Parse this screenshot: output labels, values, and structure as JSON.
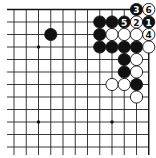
{
  "diagram": {
    "type": "go-board-fragment",
    "grid": {
      "columns": 12,
      "rows": 12,
      "edges": [
        "top",
        "right"
      ]
    },
    "colors": {
      "black": "#111111",
      "white": "#ffffff",
      "line": "#222222",
      "background": "#ffffff"
    },
    "star_points": [
      {
        "col": 2,
        "row": 3
      },
      {
        "col": 2,
        "row": 9
      },
      {
        "col": 8,
        "row": 9
      }
    ],
    "stones": [
      {
        "col": 10,
        "row": 0,
        "color": "black",
        "label": "3"
      },
      {
        "col": 11,
        "row": 0,
        "color": "white",
        "label": "6"
      },
      {
        "col": 7,
        "row": 1,
        "color": "black",
        "label": ""
      },
      {
        "col": 8,
        "row": 1,
        "color": "black",
        "label": ""
      },
      {
        "col": 9,
        "row": 1,
        "color": "black",
        "label": "5"
      },
      {
        "col": 10,
        "row": 1,
        "color": "white",
        "label": "2"
      },
      {
        "col": 11,
        "row": 1,
        "color": "black",
        "label": "1"
      },
      {
        "col": 3,
        "row": 2,
        "color": "black",
        "label": ""
      },
      {
        "col": 7,
        "row": 2,
        "color": "black",
        "label": ""
      },
      {
        "col": 8,
        "row": 2,
        "color": "white",
        "label": ""
      },
      {
        "col": 9,
        "row": 2,
        "color": "white",
        "label": ""
      },
      {
        "col": 10,
        "row": 2,
        "color": "white",
        "label": ""
      },
      {
        "col": 11,
        "row": 2,
        "color": "white",
        "label": "4"
      },
      {
        "col": 7,
        "row": 3,
        "color": "black",
        "label": ""
      },
      {
        "col": 8,
        "row": 3,
        "color": "black",
        "label": ""
      },
      {
        "col": 9,
        "row": 3,
        "color": "black",
        "label": ""
      },
      {
        "col": 10,
        "row": 3,
        "color": "black",
        "label": ""
      },
      {
        "col": 11,
        "row": 3,
        "color": "white",
        "label": ""
      },
      {
        "col": 9,
        "row": 4,
        "color": "black",
        "label": ""
      },
      {
        "col": 10,
        "row": 4,
        "color": "white",
        "label": ""
      },
      {
        "col": 9,
        "row": 5,
        "color": "black",
        "label": ""
      },
      {
        "col": 10,
        "row": 5,
        "color": "white",
        "label": ""
      },
      {
        "col": 8,
        "row": 6,
        "color": "white",
        "label": ""
      },
      {
        "col": 9,
        "row": 6,
        "color": "white",
        "label": ""
      },
      {
        "col": 10,
        "row": 6,
        "color": "black",
        "label": ""
      },
      {
        "col": 10,
        "row": 7,
        "color": "white",
        "label": ""
      }
    ]
  }
}
